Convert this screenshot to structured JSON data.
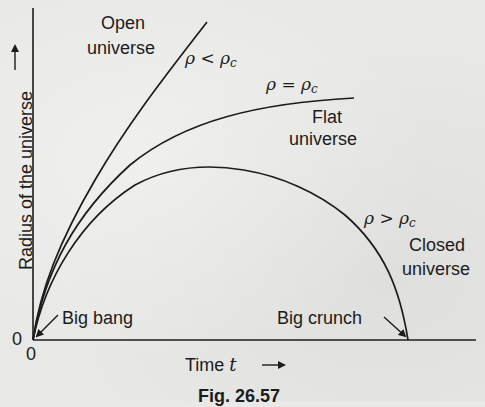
{
  "figure": {
    "caption": "Fig. 26.57",
    "y_axis_label": "Radius of the universe",
    "y_axis_arrow": "→",
    "x_axis_label": "Time t",
    "x_axis_arrow": "→",
    "origin_y_tick": "0",
    "origin_x_tick": "0"
  },
  "curves": [
    {
      "id": "open",
      "name": "Open universe",
      "name_line1": "Open",
      "name_line2": "universe",
      "condition": "ρ < ρc",
      "rho": "ρ",
      "op": "<",
      "sub": "c"
    },
    {
      "id": "flat",
      "name": "Flat universe",
      "name_line1": "Flat",
      "name_line2": "universe",
      "condition": "ρ = ρc",
      "rho": "ρ",
      "op": "=",
      "sub": "c"
    },
    {
      "id": "closed",
      "name": "Closed universe",
      "name_line1": "Closed",
      "name_line2": "universe",
      "condition": "ρ > ρc",
      "rho": "ρ",
      "op": ">",
      "sub": "c"
    }
  ],
  "annotations": {
    "big_bang": "Big bang",
    "big_crunch": "Big crunch"
  },
  "colors": {
    "ink": "#1c1c1c",
    "paper": "#e8e8e6"
  },
  "chart_data": {
    "type": "line",
    "title": "Fig. 26.57",
    "xlabel": "Time t",
    "ylabel": "Radius of the universe",
    "series": [
      {
        "name": "Open universe (ρ < ρc)",
        "shape": "monotonically increasing, steepest"
      },
      {
        "name": "Flat universe (ρ = ρc)",
        "shape": "increasing, flattening asymptotically"
      },
      {
        "name": "Closed universe (ρ > ρc)",
        "shape": "rises to a maximum then falls back to zero (Big crunch)"
      }
    ],
    "annotations": [
      "Big bang at origin (0,0)",
      "Big crunch where closed curve returns to zero radius"
    ],
    "grid": false
  }
}
